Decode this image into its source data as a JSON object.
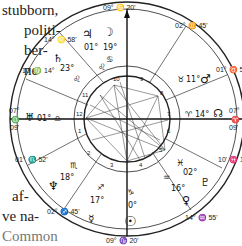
{
  "page_text": {
    "top_left": [
      "stubborn,",
      "politi-",
      "ber-",
      "ne"
    ],
    "bottom_left": [
      "af-",
      "ve na-",
      "Common"
    ]
  },
  "chart": {
    "type": "natal-chart-wheel",
    "house_cusps": [
      {
        "id": "mc",
        "label": "09° ♋ 20'",
        "position": "top"
      },
      {
        "id": "ic",
        "label": "09° ♑ 20'",
        "position": "bottom"
      },
      {
        "id": "asc",
        "deg": "07°",
        "sign": "♎",
        "min": "09'",
        "position": "left"
      },
      {
        "id": "dsc",
        "deg": "07°",
        "sign": "♈",
        "min": "09'",
        "position": "right"
      },
      {
        "id": "c11",
        "deg": "14°",
        "sign": "♌",
        "min": "58'"
      },
      {
        "id": "c12",
        "deg": "10'",
        "sign": "♍",
        "min": "14°"
      },
      {
        "id": "c9",
        "deg": "02°",
        "sign": "♊",
        "min": "45'"
      },
      {
        "id": "c8",
        "deg": "01°",
        "sign": "♉",
        "min": "52'"
      },
      {
        "id": "c2",
        "deg": "01°",
        "sign": "♏",
        "min": "52'"
      },
      {
        "id": "c3",
        "deg": "02°",
        "sign": "♐",
        "min": "45'"
      },
      {
        "id": "c5",
        "deg": "14°",
        "sign": "♒",
        "min": "55'"
      },
      {
        "id": "c6",
        "deg": "10'",
        "sign": "♓",
        "min": "14°"
      }
    ],
    "planets": [
      {
        "name": "jupiter",
        "glyph": "♃",
        "degree": "01°"
      },
      {
        "name": "moon",
        "glyph": "☽",
        "degree": "19°",
        "sign": "♋"
      },
      {
        "name": "saturn",
        "glyph": "♄",
        "degree": "23°"
      },
      {
        "name": "uranus",
        "glyph": "♅",
        "degree": "01°",
        "sign": "♎"
      },
      {
        "name": "mars",
        "glyph": "♂",
        "degree": "11°",
        "sign": "♉"
      },
      {
        "name": "north-node",
        "glyph": "☊",
        "degree": "14°",
        "sign": "♈"
      },
      {
        "name": "neptune",
        "glyph": "♆",
        "degree": "18°",
        "sign": "♏"
      },
      {
        "name": "mercury",
        "glyph": "☿",
        "degree": "17°",
        "sign": "♐"
      },
      {
        "name": "sun",
        "glyph": "☉",
        "degree": "0°",
        "sign": "♑"
      },
      {
        "name": "venus",
        "glyph": "♀",
        "degree": "16°",
        "sign": "♒"
      },
      {
        "name": "pluto",
        "glyph": "♇",
        "degree": "02°",
        "sign": "♓"
      }
    ],
    "house_numbers": [
      "1",
      "2",
      "3",
      "4",
      "5",
      "6",
      "7",
      "8",
      "9",
      "10",
      "11",
      "12"
    ]
  }
}
